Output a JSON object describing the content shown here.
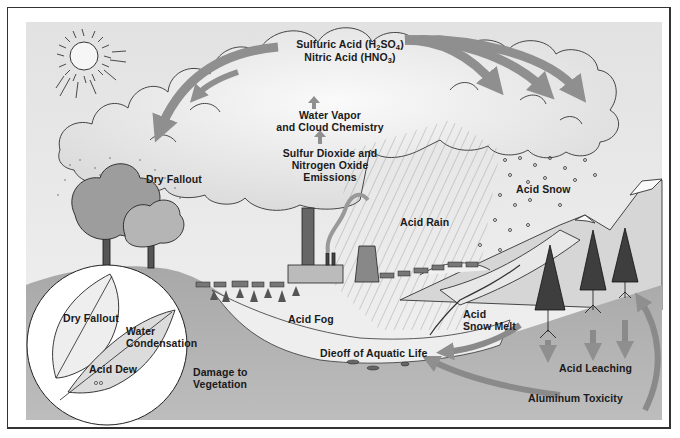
{
  "diagram": {
    "type": "illustration",
    "colors": {
      "sky": "#ececec",
      "cloud": "#f4f4f4",
      "arrow": "#8f8f8f",
      "ground": "#9c9c9c",
      "lake": "#e8e8e8",
      "text": "#1a1a1a"
    },
    "labels": {
      "sulfuric_acid": "Sulfuric Acid (H",
      "sulfuric_sub1": "2",
      "sulfuric_mid": "SO",
      "sulfuric_sub2": "4",
      "sulfuric_end": ")",
      "nitric_acid": "Nitric Acid (HNO",
      "nitric_sub": "3",
      "nitric_end": ")",
      "water_vapor_1": "Water Vapor",
      "water_vapor_2": "and Cloud Chemistry",
      "emissions_1": "Sulfur Dioxide and",
      "emissions_2": "Nitrogen Oxide",
      "emissions_3": "Emissions",
      "dry_fallout": "Dry Fallout",
      "acid_rain": "Acid Rain",
      "acid_snow": "Acid Snow",
      "acid_fog": "Acid Fog",
      "acid_snow_melt_1": "Acid",
      "acid_snow_melt_2": "Snow Melt",
      "dieoff": "Dieoff of Aquatic Life",
      "damage_1": "Damage to",
      "damage_2": "Vegetation",
      "acid_leaching": "Acid Leaching",
      "aluminum_toxicity": "Aluminum Toxicity"
    },
    "inset": {
      "dry_fallout": "Dry Fallout",
      "water_condensation_1": "Water",
      "water_condensation_2": "Condensation",
      "acid_dew": "Acid Dew"
    }
  }
}
